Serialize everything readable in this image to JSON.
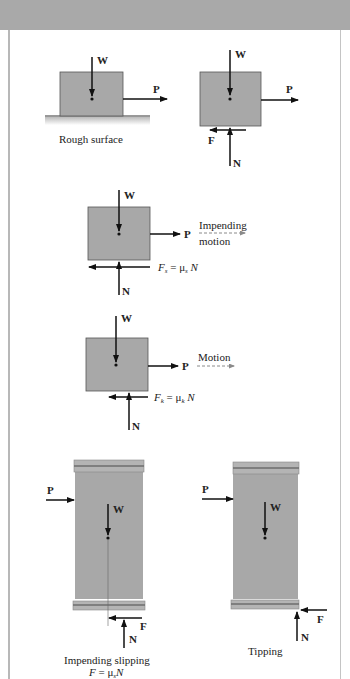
{
  "figure": {
    "colors": {
      "block": "#a8a8a8",
      "block_edge": "#555555",
      "band": "#9a9a9a",
      "band_dark": "#6e6e6e",
      "arrow": "#111111",
      "header": "#a9a9a9",
      "dashed": "#8a8a8a"
    },
    "panel1": {
      "caption": "Rough surface",
      "weight": "W",
      "push": "P"
    },
    "panel2": {
      "weight": "W",
      "push": "P",
      "friction": "F",
      "normal": "N"
    },
    "panel3": {
      "weight": "W",
      "push": "P",
      "normal": "N",
      "motion_line1": "Impending",
      "motion_line2": "motion",
      "friction_eq_F": "F",
      "friction_eq_sub": "s",
      "friction_eq_rest": " = μ",
      "friction_eq_mu_sub": "s",
      "friction_eq_N": " N"
    },
    "panel4": {
      "weight": "W",
      "push": "P",
      "normal": "N",
      "motion": "Motion",
      "friction_eq_F": "F",
      "friction_eq_sub": "k",
      "friction_eq_rest": " = μ",
      "friction_eq_mu_sub": "k",
      "friction_eq_N": " N"
    },
    "panel5": {
      "push": "P",
      "weight": "W",
      "friction": "F",
      "normal": "N",
      "caption_line1": "Impending slipping",
      "caption_line2_F": "F",
      "caption_line2_rest": " = μ",
      "caption_line2_sub": "s",
      "caption_line2_N": "N"
    },
    "panel6": {
      "push": "P",
      "weight": "W",
      "friction": "F",
      "normal": "N",
      "caption": "Tipping"
    }
  }
}
